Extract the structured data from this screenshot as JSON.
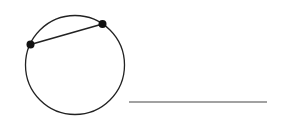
{
  "diagram": {
    "circle": {
      "cx": 75,
      "cy": 65,
      "r": 49.5,
      "stroke": "#222222"
    },
    "chord": {
      "p1": {
        "x": 30.5,
        "y": 44.5
      },
      "p2": {
        "x": 102.5,
        "y": 24
      },
      "stroke": "#222222"
    },
    "points": [
      {
        "x": 30.5,
        "y": 44.5,
        "r": 4,
        "fill": "#111111"
      },
      {
        "x": 102.5,
        "y": 24,
        "r": 4,
        "fill": "#111111"
      }
    ],
    "segment": {
      "x1": 129,
      "y1": 102,
      "x2": 267,
      "y2": 102,
      "stroke": "#444444"
    }
  }
}
